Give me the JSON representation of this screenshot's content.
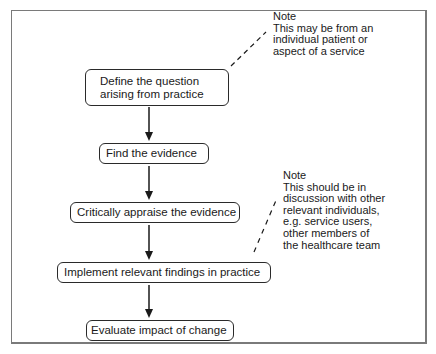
{
  "diagram": {
    "type": "flowchart",
    "steps": [
      {
        "id": "define",
        "lines": [
          "Define the question",
          "arising from practice"
        ]
      },
      {
        "id": "find",
        "label": "Find the evidence"
      },
      {
        "id": "appraise",
        "label": "Critically appraise the evidence"
      },
      {
        "id": "implement",
        "label": "Implement relevant findings in practice"
      },
      {
        "id": "evaluate",
        "label": "Evaluate impact of change"
      }
    ],
    "notes": [
      {
        "attached_to": "define",
        "title": "Note",
        "lines": [
          "This may be from an",
          "individual patient or",
          "aspect of a service"
        ]
      },
      {
        "attached_to": "implement",
        "title": "Note",
        "lines": [
          "This should be in",
          "discussion with other",
          "relevant individuals,",
          "e.g. service users,",
          "other members of",
          "the healthcare team"
        ]
      }
    ],
    "colors": {
      "stroke": "#2a2a2a",
      "frame": "#7a7a7a",
      "background": "#ffffff"
    }
  }
}
